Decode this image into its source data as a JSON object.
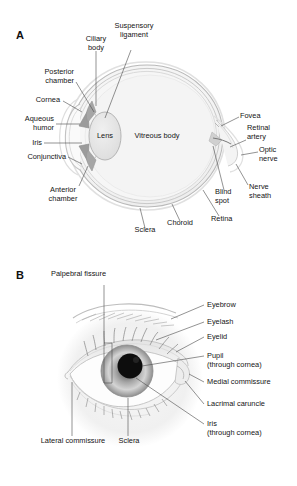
{
  "figure": {
    "background": "#ffffff",
    "panels": [
      {
        "letter": "A",
        "name": "sagittal-section-of-eyeball",
        "labels": [
          {
            "key": "ciliary_body",
            "text": "Ciliary\nbody"
          },
          {
            "key": "suspensory_ligament",
            "text": "Suspensory\nligament"
          },
          {
            "key": "posterior_chamber",
            "text": "Posterior\nchamber"
          },
          {
            "key": "cornea",
            "text": "Cornea"
          },
          {
            "key": "aqueous_humor",
            "text": "Aqueous\nhumor"
          },
          {
            "key": "iris",
            "text": "Iris"
          },
          {
            "key": "conjunctiva",
            "text": "Conjunctiva"
          },
          {
            "key": "anterior_chamber",
            "text": "Anterior\nchamber"
          },
          {
            "key": "lens",
            "text": "Lens"
          },
          {
            "key": "vitreous_body",
            "text": "Vitreous body"
          },
          {
            "key": "fovea",
            "text": "Fovea"
          },
          {
            "key": "retinal_artery",
            "text": "Retinal\nartery"
          },
          {
            "key": "optic_nerve",
            "text": "Optic\nnerve"
          },
          {
            "key": "nerve_sheath",
            "text": "Nerve\nsheath"
          },
          {
            "key": "blind_spot",
            "text": "Blind\nspot"
          },
          {
            "key": "retina",
            "text": "Retina"
          },
          {
            "key": "choroid",
            "text": "Choroid"
          },
          {
            "key": "sclera",
            "text": "Sclera"
          }
        ]
      },
      {
        "letter": "B",
        "name": "external-anterior-view-of-eye",
        "labels": [
          {
            "key": "palpebral_fissure",
            "text": "Palpebral fissure"
          },
          {
            "key": "eyebrow",
            "text": "Eyebrow"
          },
          {
            "key": "eyelash",
            "text": "Eyelash"
          },
          {
            "key": "eyelid",
            "text": "Eyelid"
          },
          {
            "key": "pupil",
            "text": "Pupil\n(through cornea)"
          },
          {
            "key": "medial_commissure",
            "text": "Medial commissure"
          },
          {
            "key": "lacrimal_caruncle",
            "text": "Lacrimal caruncle"
          },
          {
            "key": "iris_b",
            "text": "Iris\n(through cornea)"
          },
          {
            "key": "lateral_commissure",
            "text": "Lateral commissure"
          },
          {
            "key": "sclera_b",
            "text": "Sclera"
          }
        ]
      }
    ],
    "colors": {
      "text": "#141414",
      "leader": "#4a4a4a",
      "globe_fill": "#f2f2f2",
      "sclera_line": "#b9b9b9",
      "choroid_line": "#c9c9c9",
      "retina_line": "#d7d7d7",
      "lens_fill": "#e6e6e6",
      "vitreous_fill": "#f4f4f4",
      "iris_outer": "#9a9a9a",
      "iris_inner": "#d8d8d8",
      "pupil": "#0d0d0d",
      "face_halo": "#f0f0f0",
      "skin": "#fbfbfb"
    }
  }
}
